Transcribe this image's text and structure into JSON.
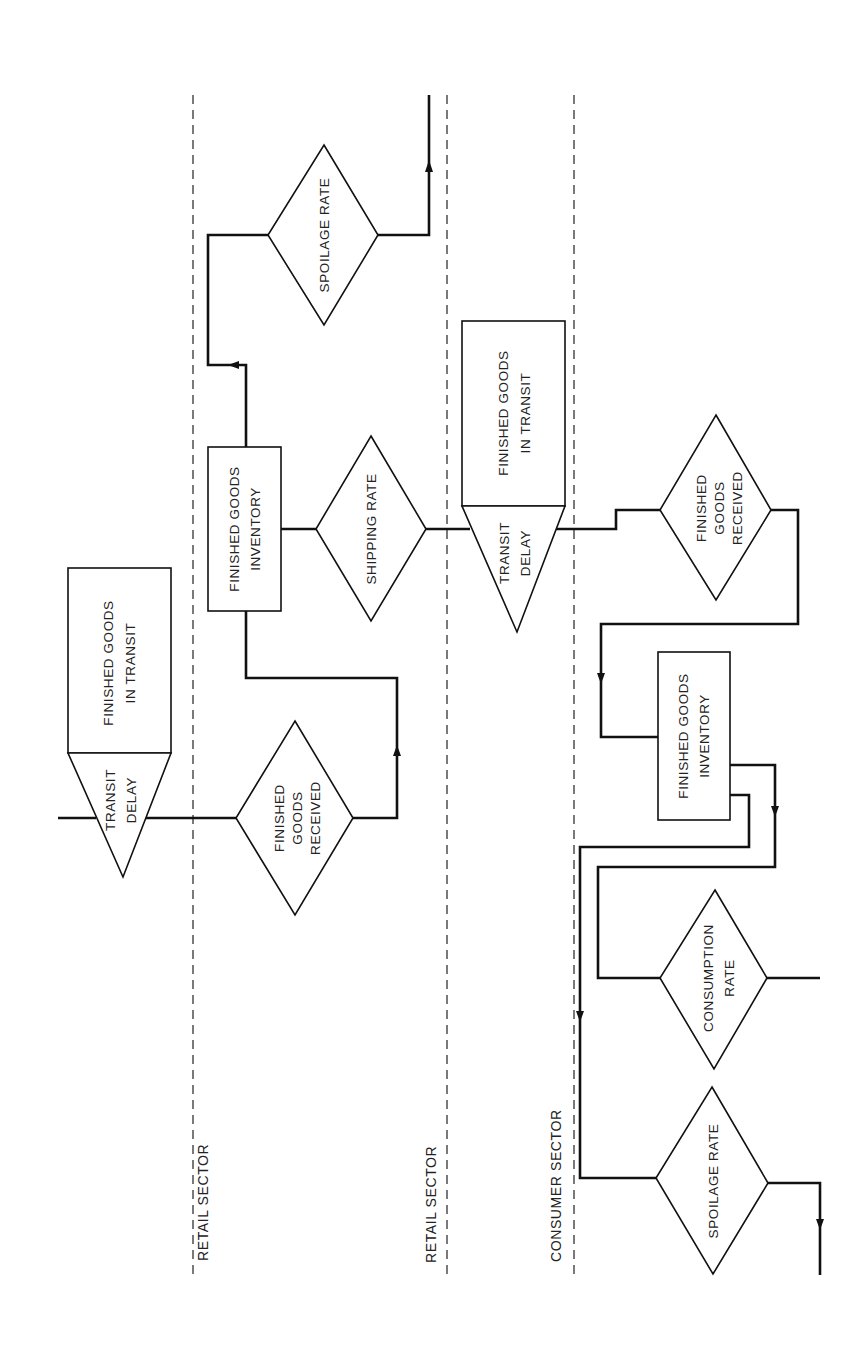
{
  "sectors": {
    "retail_left": "RETAIL SECTOR",
    "retail_right": "RETAIL SECTOR",
    "consumer": "CONSUMER SECTOR"
  },
  "retail": {
    "transit": {
      "level_line1": "FINISHED GOODS",
      "level_line2": "IN TRANSIT",
      "delay_line1": "TRANSIT",
      "delay_line2": "DELAY"
    },
    "received": {
      "line1": "FINISHED",
      "line2": "GOODS",
      "line3": "RECEIVED"
    },
    "inventory": {
      "line1": "FINISHED GOODS",
      "line2": "INVENTORY"
    },
    "shipping_rate": "SHIPPING RATE",
    "spoilage_rate": "SPOILAGE RATE"
  },
  "consumer": {
    "transit": {
      "level_line1": "FINISHED GOODS",
      "level_line2": "IN TRANSIT",
      "delay_line1": "TRANSIT",
      "delay_line2": "DELAY"
    },
    "received": {
      "line1": "FINISHED",
      "line2": "GOODS",
      "line3": "RECEIVED"
    },
    "inventory": {
      "line1": "FINISHED GOODS",
      "line2": "INVENTORY"
    },
    "consumption_rate": {
      "line1": "CONSUMPTION",
      "line2": "RATE"
    },
    "spoilage_rate": "SPOILAGE RATE"
  }
}
